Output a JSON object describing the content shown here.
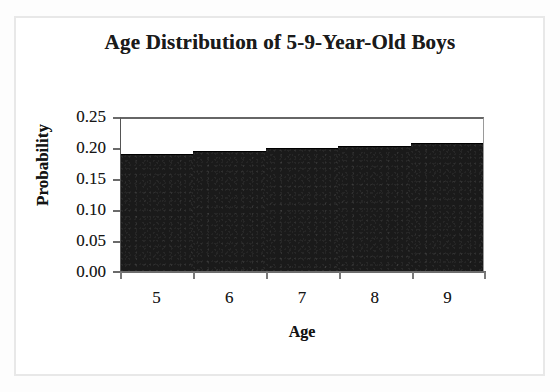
{
  "chart_data": {
    "type": "bar",
    "title": "Age Distribution of 5-9-Year-Old Boys",
    "xlabel": "Age",
    "ylabel": "Probability",
    "categories": [
      "5",
      "6",
      "7",
      "8",
      "9"
    ],
    "values": [
      0.193,
      0.197,
      0.203,
      0.206,
      0.211
    ],
    "ylim": [
      0.0,
      0.25
    ],
    "ytick_labels": [
      "0.25",
      "0.20",
      "0.15",
      "0.10",
      "0.05",
      "0.00"
    ],
    "ytick_values": [
      0.25,
      0.2,
      0.15,
      0.1,
      0.05,
      0.0
    ],
    "xtick_labels": [
      "5",
      "6",
      "7",
      "8",
      "9"
    ],
    "grid": false,
    "legend": false,
    "bar_color": "#1a1a1a",
    "plot_background": "#ffffff",
    "axis_color": "#6a6a6a"
  },
  "figure": {
    "title": "Age Distribution of 5-9-Year-Old Boys",
    "x_axis_title": "Age",
    "y_axis_title": "Probability",
    "border_color": "#e8e8e8",
    "page_background": "#fdfdfd"
  }
}
